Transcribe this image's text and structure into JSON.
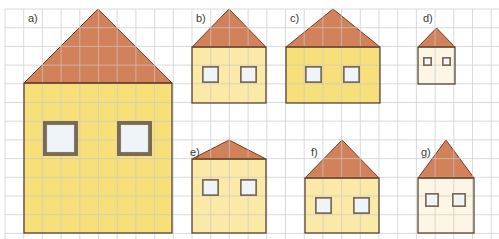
{
  "grid": {
    "origin_x": 5,
    "origin_y": 9,
    "cell": 18.7,
    "cols": 26,
    "rows": 12,
    "line_color": "#c9c9c9"
  },
  "colors": {
    "roof": "#d2825a",
    "roof_stroke": "#7a3b20",
    "wall_yellow": "#f7df7a",
    "wall_light": "#fbe9a8",
    "wall_pale": "#fdf6e6",
    "wall_stroke": "#4a3a2a",
    "window_frame": "#7a6a55",
    "window_glass": "#eef4f8"
  },
  "houses": [
    {
      "label": "a)",
      "x": 24,
      "y": 83,
      "w": 148,
      "h": 150,
      "apex_y": 9,
      "fill": "wall_yellow",
      "label_x": 28,
      "label_y": 13,
      "windows": [
        {
          "x": 43,
          "y": 121,
          "s": 35
        },
        {
          "x": 117,
          "y": 121,
          "s": 35
        }
      ]
    },
    {
      "label": "b)",
      "x": 192,
      "y": 47,
      "w": 74,
      "h": 56,
      "apex_y": 9,
      "fill": "wall_light",
      "label_x": 196,
      "label_y": 13,
      "windows": [
        {
          "x": 202,
          "y": 66,
          "s": 17
        },
        {
          "x": 240,
          "y": 66,
          "s": 17
        }
      ]
    },
    {
      "label": "c)",
      "x": 286,
      "y": 47,
      "w": 94,
      "h": 56,
      "apex_y": 9,
      "fill": "wall_yellow",
      "label_x": 290,
      "label_y": 13,
      "windows": [
        {
          "x": 305,
          "y": 66,
          "s": 17
        },
        {
          "x": 343,
          "y": 66,
          "s": 17
        }
      ]
    },
    {
      "label": "d)",
      "x": 418,
      "y": 47,
      "w": 37,
      "h": 37,
      "apex_y": 28,
      "fill": "wall_pale",
      "label_x": 423,
      "label_y": 13,
      "windows": [
        {
          "x": 423,
          "y": 57,
          "s": 9
        },
        {
          "x": 442,
          "y": 57,
          "s": 9
        }
      ]
    },
    {
      "label": "e)",
      "x": 192,
      "y": 159,
      "w": 74,
      "h": 74,
      "apex_y": 140,
      "fill": "wall_light",
      "label_x": 190,
      "label_y": 147,
      "windows": [
        {
          "x": 202,
          "y": 179,
          "s": 17
        },
        {
          "x": 240,
          "y": 179,
          "s": 17
        }
      ]
    },
    {
      "label": "f)",
      "x": 305,
      "y": 178,
      "w": 74,
      "h": 55,
      "apex_y": 140,
      "fill": "wall_light",
      "label_x": 311,
      "label_y": 147,
      "windows": [
        {
          "x": 315,
          "y": 197,
          "s": 17
        },
        {
          "x": 353,
          "y": 197,
          "s": 17
        }
      ]
    },
    {
      "label": "g)",
      "x": 418,
      "y": 178,
      "w": 56,
      "h": 55,
      "apex_y": 140,
      "fill": "wall_pale",
      "label_x": 421,
      "label_y": 147,
      "windows": [
        {
          "x": 425,
          "y": 193,
          "s": 14
        },
        {
          "x": 452,
          "y": 193,
          "s": 14
        }
      ]
    }
  ]
}
